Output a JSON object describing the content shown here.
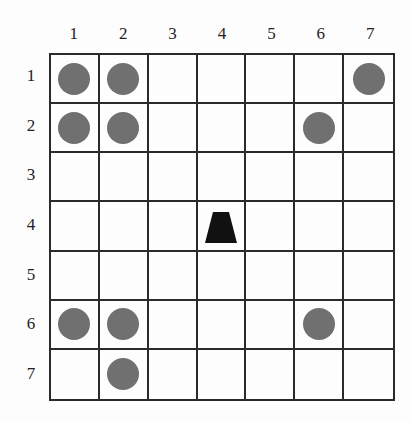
{
  "grid": {
    "rows": 7,
    "cols": 7,
    "col_labels": [
      "1",
      "2",
      "3",
      "4",
      "5",
      "6",
      "7"
    ],
    "row_labels": [
      "1",
      "2",
      "3",
      "4",
      "5",
      "6",
      "7"
    ],
    "disc_color": "#707070",
    "agent_color": "#111111",
    "discs": [
      {
        "row": 1,
        "col": 1
      },
      {
        "row": 1,
        "col": 2
      },
      {
        "row": 1,
        "col": 7
      },
      {
        "row": 2,
        "col": 1
      },
      {
        "row": 2,
        "col": 2
      },
      {
        "row": 2,
        "col": 6
      },
      {
        "row": 6,
        "col": 1
      },
      {
        "row": 6,
        "col": 2
      },
      {
        "row": 6,
        "col": 6
      },
      {
        "row": 7,
        "col": 2
      }
    ],
    "agent": {
      "row": 4,
      "col": 4,
      "shape": "trapezoid"
    }
  }
}
